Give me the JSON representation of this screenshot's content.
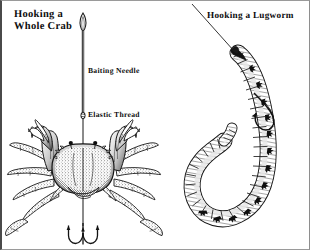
{
  "figure": {
    "background_color": "#ffffff",
    "ink_color": "#111111",
    "border_color": "#4a4a4a",
    "style": "black-and-white line engraving"
  },
  "panels": {
    "left": {
      "title": "Hooking a\nWhole Crab",
      "subject": "whole-crab-illustration",
      "callouts": [
        {
          "id": "baiting-needle",
          "label": "Baiting Needle"
        },
        {
          "id": "elastic-thread",
          "label": "Elastic Thread"
        }
      ],
      "elements": [
        "baiting-needle",
        "elastic-thread",
        "crab",
        "treble-hook"
      ]
    },
    "right": {
      "title": "Hooking a Lugworm",
      "subject": "lugworm-illustration",
      "callouts": [],
      "elements": [
        "fishing-line",
        "lugworm",
        "hook"
      ]
    }
  }
}
